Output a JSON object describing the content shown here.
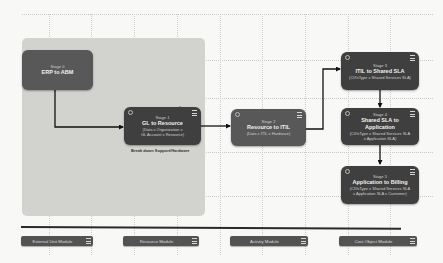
{
  "diagram": {
    "grouping_caption": "Break down Support/Hardware",
    "nodes": [
      {
        "id": "stage0",
        "stage": "Stage 0",
        "title": "ERP to ABM",
        "subtitle": ""
      },
      {
        "id": "stage1",
        "stage": "Stage 1",
        "title": "GL to Resource",
        "subtitle_lines": [
          "(Data x Organization x",
          "GL Account x Resource)"
        ]
      },
      {
        "id": "stage2",
        "stage": "Stage 2",
        "title": "Resource to ITIL",
        "subtitle_lines": [
          "(Data x ITIL x Hardware)"
        ]
      },
      {
        "id": "stage3",
        "stage": "Stage 3",
        "title": "ITIL to Shared SLA",
        "subtitle_lines": [
          "(CI/IsType x Shared Services SLA)"
        ]
      },
      {
        "id": "stage4",
        "stage": "Stage 4",
        "title": "Shared SLA to Application",
        "subtitle_lines": [
          "(CI/IsType x Shared Services SLA",
          "x Application SLA)"
        ]
      },
      {
        "id": "stage5",
        "stage": "Stage 5",
        "title": "Application to Billing",
        "subtitle_lines": [
          "(CI/IsType x Shared Services SLA",
          "x Application SLA x Customer)"
        ]
      }
    ],
    "edges": [
      {
        "from": "stage0",
        "to": "stage1"
      },
      {
        "from": "stage1",
        "to": "stage2"
      },
      {
        "from": "stage2",
        "to": "stage3"
      },
      {
        "from": "stage3",
        "to": "stage4"
      },
      {
        "from": "stage4",
        "to": "stage5"
      }
    ]
  },
  "modules": [
    {
      "label": "External Unit Module",
      "icon": "menu-icon"
    },
    {
      "label": "Resource Module",
      "icon": "menu-icon"
    },
    {
      "label": "Activity Module",
      "icon": "menu-icon"
    },
    {
      "label": "Cost Object Module",
      "icon": "menu-icon"
    }
  ]
}
